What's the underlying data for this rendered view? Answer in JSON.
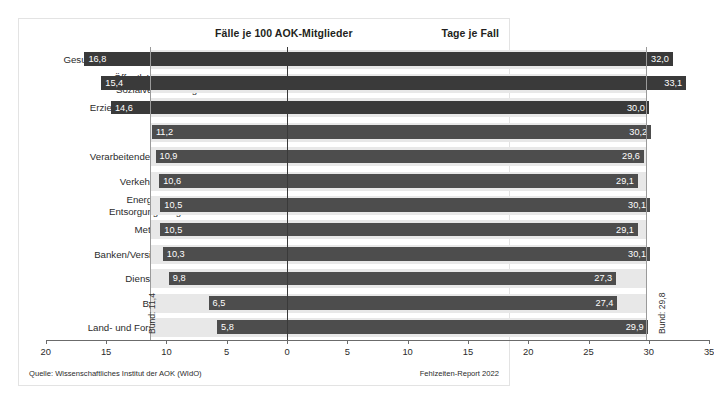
{
  "header": {
    "left_title": "Fälle je 100 AOK-Mitglieder",
    "right_title": "Tage je Fall"
  },
  "footer": {
    "source": "Quelle: Wissenschaftliches Institut der AOK (WIdO)",
    "report": "Fehlzeiten-Report 2022"
  },
  "reference": {
    "left_label": "Bund: 11,4",
    "right_label": "Bund: 29,8",
    "left_value": 11.4,
    "right_value": 29.8
  },
  "colors": {
    "bar": "#4d4d4d",
    "bar_dark": "#3a3a3a",
    "band": "#e8e8e8",
    "axis": "#6b6b6b",
    "text": "#231f20"
  },
  "chart_data": {
    "type": "bar",
    "orientation": "horizontal",
    "layout": "diverging-butterfly",
    "title": "",
    "categories": [
      "Gesundheits- und Sozialwesen",
      "Öffentl. Verwaltung/ Sozialversicherung",
      "Erziehung und Unterricht",
      "Handel",
      "Verarbeitendes Gewerbe",
      "Verkehr/Transport",
      "Energie/Wasser/ Entsorgung/Bergbau",
      "Metallindustrie",
      "Banken/Versicherungen",
      "Dienstleistungen",
      "Baugewerbe",
      "Land- und Forstwirtschaft"
    ],
    "category_lines": [
      [
        "Gesundheits- und Sozialwesen"
      ],
      [
        "Öffentl. Verwaltung/",
        "Sozialversicherung"
      ],
      [
        "Erziehung und Unterricht"
      ],
      [
        "Handel"
      ],
      [
        "Verarbeitendes Gewerbe"
      ],
      [
        "Verkehr/Transport"
      ],
      [
        "Energie/Wasser/",
        "Entsorgung/Bergbau"
      ],
      [
        "Metallindustrie"
      ],
      [
        "Banken/Versicherungen"
      ],
      [
        "Dienstleistungen"
      ],
      [
        "Baugewerbe"
      ],
      [
        "Land- und Forstwirtschaft"
      ]
    ],
    "series": [
      {
        "name": "Fälle je 100 AOK-Mitglieder",
        "side": "left",
        "values": [
          16.8,
          15.4,
          14.6,
          11.2,
          10.9,
          10.6,
          10.5,
          10.5,
          10.3,
          9.8,
          6.5,
          5.8
        ],
        "labels": [
          "16,8",
          "15,4",
          "14,6",
          "11,2",
          "10,9",
          "10,6",
          "10,5",
          "10,5",
          "10,3",
          "9,8",
          "6,5",
          "5,8"
        ]
      },
      {
        "name": "Tage je Fall",
        "side": "right",
        "values": [
          32.0,
          33.1,
          30.0,
          30.2,
          29.6,
          29.1,
          30.1,
          29.1,
          30.1,
          27.3,
          27.4,
          29.9
        ],
        "labels": [
          "32,0",
          "33,1",
          "30,0",
          "30,2",
          "29,6",
          "29,1",
          "30,1",
          "29,1",
          "30,1",
          "27,3",
          "27,4",
          "29,9"
        ]
      }
    ],
    "left_axis": {
      "max": 20,
      "ticks": [
        20,
        15,
        10,
        5,
        0
      ],
      "tick_labels": [
        "20",
        "15",
        "10",
        "5",
        "0"
      ]
    },
    "right_axis": {
      "max": 35,
      "ticks": [
        5,
        10,
        15,
        20,
        25,
        30,
        35
      ],
      "tick_labels": [
        "5",
        "10",
        "15",
        "20",
        "25",
        "30",
        "35"
      ]
    },
    "grid": false,
    "legend": "none"
  }
}
